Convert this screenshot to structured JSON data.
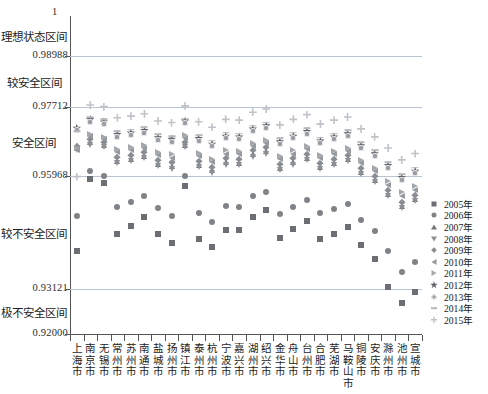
{
  "chart_data": {
    "type": "scatter",
    "title": "",
    "subtitle": "",
    "xlabel": "",
    "ylabel": "",
    "ylim": [
      0.92,
      1.0
    ],
    "grid": true,
    "legend_position": "right",
    "y_axis_top_label": "1",
    "y_ticks": [
      0.92,
      0.93121,
      0.95968,
      0.97712,
      0.98988
    ],
    "y_tick_labels": [
      "0.92000",
      "0.93121",
      "0.95968",
      "0.97712",
      "0.98988"
    ],
    "zone_labels": [
      {
        "label": "理想状态区间",
        "from": 0.98988,
        "to": 1.0
      },
      {
        "label": "较安全区间",
        "from": 0.97712,
        "to": 0.98988
      },
      {
        "label": "安全区间",
        "from": 0.95968,
        "to": 0.97712
      },
      {
        "label": "较不安全区间",
        "from": 0.93121,
        "to": 0.95968
      },
      {
        "label": "极不安全区间",
        "from": 0.92,
        "to": 0.93121
      }
    ],
    "categories": [
      "上海市",
      "南京市",
      "无锡市",
      "常州市",
      "苏州市",
      "南通市",
      "盐城市",
      "扬州市",
      "镇江市",
      "泰州市",
      "杭州市",
      "宁波市",
      "嘉兴市",
      "湖州市",
      "绍兴市",
      "金华市",
      "舟山市",
      "台州市",
      "合肥市",
      "芜湖市",
      "马鞍山市",
      "铜陵市",
      "安庆市",
      "滁州市",
      "池州市",
      "宣城市"
    ],
    "series": [
      {
        "name": "2005年",
        "marker": "square",
        "color": "#6b6f73",
        "values": [
          0.941,
          0.959,
          0.958,
          0.9452,
          0.9472,
          0.9495,
          0.9452,
          0.943,
          0.9572,
          0.9438,
          0.942,
          0.9462,
          0.9462,
          0.9495,
          0.9512,
          0.9442,
          0.9465,
          0.9485,
          0.9438,
          0.9452,
          0.9468,
          0.9425,
          0.9388,
          0.9318,
          0.9278,
          0.9305
        ]
      },
      {
        "name": "2006年",
        "marker": "circle",
        "color": "#7f8387",
        "values": [
          0.9498,
          0.961,
          0.9598,
          0.952,
          0.9532,
          0.9546,
          0.9516,
          0.9498,
          0.9598,
          0.9505,
          0.9482,
          0.9522,
          0.952,
          0.9548,
          0.9558,
          0.9502,
          0.952,
          0.9538,
          0.9505,
          0.9515,
          0.9528,
          0.9486,
          0.946,
          0.9408,
          0.9356,
          0.9382
        ]
      },
      {
        "name": "2007年",
        "marker": "triangle-up",
        "color": "#75797d",
        "values": [
          0.9668,
          0.9682,
          0.9675,
          0.9636,
          0.964,
          0.9648,
          0.9628,
          0.9622,
          0.9676,
          0.9626,
          0.9612,
          0.9632,
          0.963,
          0.9652,
          0.966,
          0.9618,
          0.9632,
          0.9644,
          0.962,
          0.963,
          0.964,
          0.9608,
          0.9588,
          0.9552,
          0.9522,
          0.954
        ]
      },
      {
        "name": "2008年",
        "marker": "triangle-down",
        "color": "#8c9094",
        "values": [
          0.9662,
          0.9676,
          0.967,
          0.963,
          0.9635,
          0.9642,
          0.9622,
          0.9616,
          0.967,
          0.962,
          0.9606,
          0.9626,
          0.9624,
          0.9646,
          0.9654,
          0.9612,
          0.9626,
          0.9638,
          0.9614,
          0.9624,
          0.9634,
          0.9602,
          0.9582,
          0.9546,
          0.9516,
          0.9534
        ]
      },
      {
        "name": "2009年",
        "marker": "diamond",
        "color": "#8a8e92",
        "values": [
          0.9672,
          0.969,
          0.9684,
          0.9646,
          0.965,
          0.9658,
          0.9638,
          0.9632,
          0.9684,
          0.9636,
          0.962,
          0.9642,
          0.964,
          0.9662,
          0.967,
          0.9628,
          0.9642,
          0.9654,
          0.963,
          0.964,
          0.965,
          0.9618,
          0.9598,
          0.9562,
          0.9532,
          0.955
        ]
      },
      {
        "name": "2010年",
        "marker": "triangle-left",
        "color": "#959a9e",
        "values": [
          0.9662,
          0.9698,
          0.969,
          0.9658,
          0.9662,
          0.9668,
          0.965,
          0.9644,
          0.9692,
          0.9648,
          0.9632,
          0.9654,
          0.9652,
          0.9672,
          0.968,
          0.964,
          0.9654,
          0.9666,
          0.9642,
          0.9652,
          0.966,
          0.963,
          0.961,
          0.9576,
          0.9546,
          0.9562
        ]
      },
      {
        "name": "2011年",
        "marker": "triangle-right",
        "color": "#a4a8ac",
        "values": [
          0.9668,
          0.9704,
          0.9696,
          0.9666,
          0.967,
          0.9676,
          0.9658,
          0.9652,
          0.97,
          0.9656,
          0.964,
          0.9662,
          0.966,
          0.968,
          0.9688,
          0.9648,
          0.9662,
          0.9674,
          0.965,
          0.966,
          0.9668,
          0.9638,
          0.9618,
          0.9586,
          0.9556,
          0.9572
        ]
      },
      {
        "name": "2012年",
        "marker": "star",
        "color": "#5f6367",
        "values": [
          0.9718,
          0.974,
          0.9734,
          0.9702,
          0.9706,
          0.9712,
          0.9694,
          0.969,
          0.9736,
          0.9692,
          0.9678,
          0.9698,
          0.9696,
          0.9716,
          0.9724,
          0.9684,
          0.9698,
          0.971,
          0.9686,
          0.9696,
          0.9704,
          0.9674,
          0.9654,
          0.9624,
          0.9594,
          0.961
        ]
      },
      {
        "name": "2013年",
        "marker": "circle-plus",
        "color": "#9a9ea2",
        "values": [
          0.9712,
          0.9734,
          0.9728,
          0.9696,
          0.97,
          0.9706,
          0.9688,
          0.9684,
          0.973,
          0.9686,
          0.9672,
          0.9692,
          0.969,
          0.971,
          0.9718,
          0.9678,
          0.9692,
          0.9704,
          0.968,
          0.969,
          0.9698,
          0.9668,
          0.9648,
          0.9618,
          0.9588,
          0.9604
        ]
      },
      {
        "name": "2014年",
        "marker": "dash",
        "color": "#b3b7bb",
        "values": [
          0.971,
          0.9746,
          0.974,
          0.971,
          0.9714,
          0.972,
          0.9702,
          0.9698,
          0.9742,
          0.97,
          0.9686,
          0.9706,
          0.9704,
          0.9724,
          0.9732,
          0.9692,
          0.9706,
          0.9718,
          0.9694,
          0.9704,
          0.9712,
          0.9682,
          0.9662,
          0.9632,
          0.9602,
          0.9618
        ]
      },
      {
        "name": "2015年",
        "marker": "plus",
        "color": "#bfc3c7",
        "values": [
          0.9596,
          0.9776,
          0.9772,
          0.9744,
          0.9748,
          0.9754,
          0.9736,
          0.9732,
          0.9774,
          0.9734,
          0.972,
          0.974,
          0.9738,
          0.9758,
          0.9766,
          0.9726,
          0.974,
          0.9752,
          0.9728,
          0.9738,
          0.9746,
          0.9716,
          0.9696,
          0.9668,
          0.9638,
          0.9654
        ]
      }
    ]
  }
}
